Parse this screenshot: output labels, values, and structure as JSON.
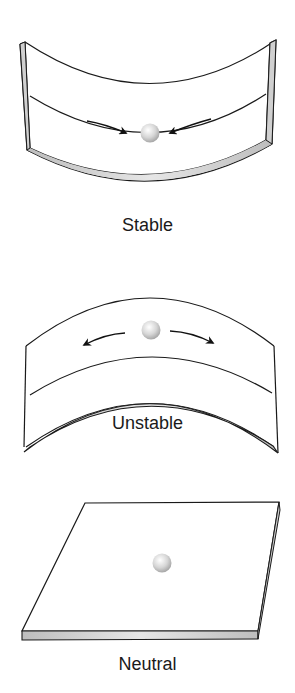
{
  "panels": [
    {
      "id": "stable",
      "label": "Stable",
      "arrows": "toward-ball"
    },
    {
      "id": "unstable",
      "label": "Unstable",
      "arrows": "away-from-ball"
    },
    {
      "id": "neutral",
      "label": "Neutral",
      "arrows": "none"
    }
  ],
  "colors": {
    "line": "#1a1a1a",
    "edge_shade": "#c8c8c8",
    "ball": "#d8d8d8",
    "background": "#ffffff"
  }
}
